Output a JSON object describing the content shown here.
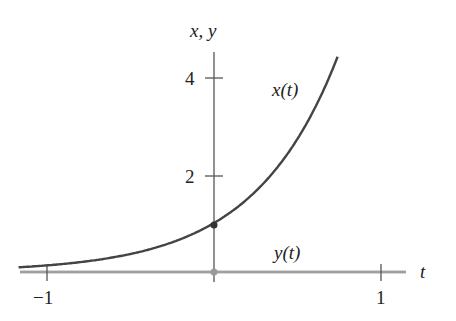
{
  "chart_data": {
    "type": "line",
    "title": "",
    "xlabel": "t",
    "ylabel": "x, y",
    "xlim": [
      -1.17,
      1.15
    ],
    "ylim": [
      0,
      4.6
    ],
    "x_ticks": [
      {
        "value": -1,
        "label": "−1"
      },
      {
        "value": 1,
        "label": "1"
      }
    ],
    "y_ticks": [
      {
        "value": 2,
        "label": "2"
      },
      {
        "value": 4,
        "label": "4"
      }
    ],
    "grid": false,
    "legend": "none",
    "series": [
      {
        "name": "x(t)",
        "formula": "e^(2t)",
        "color": "#444444",
        "x": [
          -1.17,
          -1.0,
          -0.75,
          -0.5,
          -0.25,
          0,
          0.25,
          0.5,
          0.6,
          0.7,
          0.74
        ],
        "values": [
          0.096,
          0.135,
          0.223,
          0.368,
          0.607,
          1.0,
          1.649,
          2.718,
          3.32,
          4.06,
          4.4
        ]
      },
      {
        "name": "y(t)",
        "formula": "0",
        "color": "#aaaaaa",
        "x": [
          -1.17,
          1.15
        ],
        "values": [
          0,
          0
        ]
      }
    ],
    "annotations": [
      {
        "text": "x(t)",
        "near": "upper curve"
      },
      {
        "text": "y(t)",
        "near": "t-axis"
      },
      {
        "point": [
          0,
          1
        ],
        "marker": "dot"
      },
      {
        "point": [
          0,
          0
        ],
        "marker": "dot"
      }
    ]
  },
  "labels": {
    "y_axis": "x, y",
    "t_axis": "t",
    "tick_4": "4",
    "tick_2": "2",
    "tick_neg1": "−1",
    "tick_1": "1",
    "curve_x": "x(t)",
    "curve_y": "y(t)"
  }
}
